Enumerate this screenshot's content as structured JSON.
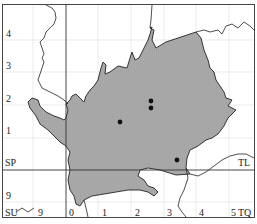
{
  "map": {
    "type": "distribution-map",
    "grid_squares": [
      "SP",
      "TL",
      "SU",
      "TQ"
    ],
    "y_axis_labels": [
      {
        "text": "4",
        "y": 34
      },
      {
        "text": "3",
        "y": 66
      },
      {
        "text": "2",
        "y": 99
      },
      {
        "text": "1",
        "y": 131
      },
      {
        "text": "9",
        "y": 196
      }
    ],
    "x_axis_labels": [
      {
        "text": "9",
        "x": 38
      },
      {
        "text": "0",
        "x": 69
      },
      {
        "text": "1",
        "x": 102
      },
      {
        "text": "2",
        "x": 135
      },
      {
        "text": "3",
        "x": 167
      },
      {
        "text": "4",
        "x": 199
      },
      {
        "text": "5",
        "x": 231
      }
    ],
    "square_labels": [
      {
        "text": "SP",
        "x": 5,
        "y": 158
      },
      {
        "text": "TL",
        "x": 238,
        "y": 158
      },
      {
        "text": "SU",
        "x": 5,
        "y": 213
      },
      {
        "text": "TQ",
        "x": 238,
        "y": 213
      }
    ],
    "records": [
      {
        "x": 151,
        "y": 101
      },
      {
        "x": 151,
        "y": 108
      },
      {
        "x": 120,
        "y": 122
      },
      {
        "x": 177,
        "y": 160
      }
    ],
    "colors": {
      "region_fill": "#a8a8a8",
      "boundary": "#222222",
      "grid_minor": "#d8d8d8",
      "grid_major": "#333333",
      "dot": "#111111"
    }
  }
}
